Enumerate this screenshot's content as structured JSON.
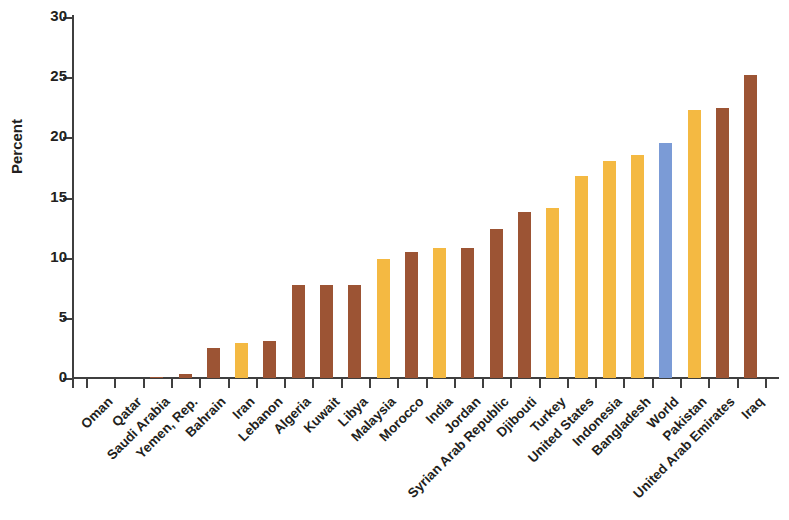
{
  "chart_data": {
    "type": "bar",
    "title": "",
    "subtitle": "",
    "xlabel": "",
    "ylabel": "Percent",
    "ylim": [
      0,
      30
    ],
    "yticks": [
      0,
      5,
      10,
      15,
      20,
      25,
      30
    ],
    "ytick_labels": [
      "0",
      "5",
      "10",
      "15",
      "20",
      "25",
      "30"
    ],
    "grid": false,
    "legend": "none",
    "categories": [
      "Oman",
      "Qatar",
      "Saudi Arabia",
      "Yemen, Rep.",
      "Bahrain",
      "Iran",
      "Lebanon",
      "Algeria",
      "Kuwait",
      "Libya",
      "Malaysia",
      "Morocco",
      "India",
      "Jordan",
      "Syrian Arab Republic",
      "Djibouti",
      "Turkey",
      "United States",
      "Indonesia",
      "Bangladesh",
      "World",
      "Pakistan",
      "United Arab Emirates",
      "Iraq"
    ],
    "values": [
      0.0,
      0.0,
      0.05,
      0.3,
      2.5,
      2.9,
      3.05,
      7.7,
      7.7,
      7.7,
      9.9,
      10.5,
      10.8,
      10.8,
      12.4,
      13.8,
      14.1,
      16.8,
      18.0,
      18.5,
      19.5,
      22.3,
      22.4,
      25.2
    ],
    "bar_colors": [
      "#9c5434",
      "#9c5434",
      "#9c5434",
      "#9c5434",
      "#9c5434",
      "#f4b942",
      "#9c5434",
      "#9c5434",
      "#9c5434",
      "#9c5434",
      "#f4b942",
      "#9c5434",
      "#f4b942",
      "#9c5434",
      "#9c5434",
      "#9c5434",
      "#f4b942",
      "#f4b942",
      "#f4b942",
      "#f4b942",
      "#7b9bd6",
      "#f4b942",
      "#9c5434",
      "#9c5434"
    ],
    "color_key": {
      "brown": "#9c5434",
      "yellow": "#f4b942",
      "blue": "#7b9bd6"
    },
    "axis_color": "#3f3f3f",
    "background": "#ffffff"
  }
}
